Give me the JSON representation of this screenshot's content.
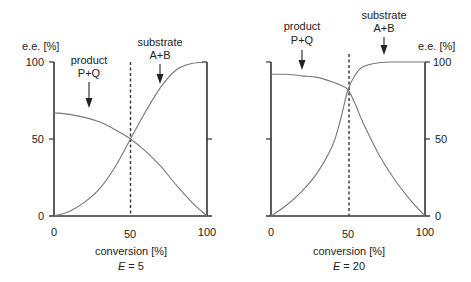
{
  "chart_data": [
    {
      "type": "line",
      "title": "E = 5",
      "subtitle_prefix": "E",
      "subtitle_value": "= 5",
      "xlabel": "conversion [%]",
      "ylabel": "e.e. [%]",
      "xlim": [
        0,
        100
      ],
      "ylim": [
        0,
        100
      ],
      "xticks": [
        "0",
        "50",
        "100"
      ],
      "yticks": [
        "0",
        "50",
        "100"
      ],
      "ylabel_side": "left",
      "grid": false,
      "vline_x": 50,
      "annotations": [
        {
          "line1": "product",
          "line2": "P+Q",
          "arrow_x": 25
        },
        {
          "line1": "substrate",
          "line2": "A+B",
          "arrow_x": 72
        }
      ],
      "series": [
        {
          "name": "product P+Q",
          "x": [
            0,
            10,
            20,
            30,
            40,
            50,
            60,
            70,
            80,
            90,
            100
          ],
          "values": [
            67,
            66,
            64,
            61,
            56,
            50,
            42,
            32,
            20,
            9,
            0
          ]
        },
        {
          "name": "substrate A+B",
          "x": [
            0,
            10,
            20,
            30,
            40,
            50,
            60,
            70,
            80,
            90,
            100
          ],
          "values": [
            0,
            3,
            9,
            18,
            32,
            50,
            68,
            84,
            95,
            99,
            100
          ]
        }
      ]
    },
    {
      "type": "line",
      "title": "E = 20",
      "subtitle_prefix": "E",
      "subtitle_value": "= 20",
      "xlabel": "conversion [%]",
      "ylabel": "e.e. [%]",
      "xlim": [
        0,
        100
      ],
      "ylim": [
        0,
        100
      ],
      "xticks": [
        "0",
        "50",
        "100"
      ],
      "yticks": [
        "0",
        "50",
        "100"
      ],
      "ylabel_side": "right",
      "grid": false,
      "vline_x": 50,
      "annotations": [
        {
          "line1": "product",
          "line2": "P+Q",
          "arrow_x": 20
        },
        {
          "line1": "substrate",
          "line2": "A+B",
          "arrow_x": 75
        }
      ],
      "series": [
        {
          "name": "product P+Q",
          "x": [
            0,
            10,
            20,
            30,
            40,
            45,
            50,
            55,
            60,
            70,
            80,
            90,
            100
          ],
          "values": [
            92,
            92,
            91,
            90,
            87,
            85,
            82,
            72,
            60,
            40,
            24,
            11,
            0
          ]
        },
        {
          "name": "substrate A+B",
          "x": [
            0,
            10,
            20,
            30,
            40,
            45,
            50,
            55,
            60,
            70,
            80,
            90,
            100
          ],
          "values": [
            0,
            7,
            16,
            28,
            46,
            62,
            82,
            92,
            97,
            99.5,
            100,
            100,
            100
          ]
        }
      ]
    }
  ]
}
